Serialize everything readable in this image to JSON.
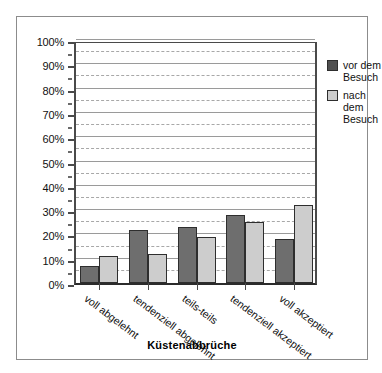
{
  "chart_data": {
    "type": "bar",
    "title": "",
    "xlabel": "Küstenabbrüche",
    "ylabel": "",
    "categories": [
      "voll abgelehnt",
      "tendenziell abgelehnt",
      "teils-teils",
      "tendenziell akzeptiert",
      "voll akzeptiert"
    ],
    "series": [
      {
        "name": "vor dem Besuch",
        "color": "#6e6e6e",
        "values": [
          7,
          22,
          23,
          28,
          18
        ]
      },
      {
        "name": "nach dem Besuch",
        "color": "#cdcdcd",
        "values": [
          11,
          12,
          19,
          25,
          32
        ]
      }
    ],
    "ylim": [
      0,
      100
    ],
    "y_unit": "%",
    "y_ticks": [
      0,
      10,
      20,
      30,
      40,
      50,
      60,
      70,
      80,
      90,
      100
    ],
    "y_tick_labels": [
      "0%",
      "10%",
      "20%",
      "30%",
      "40%",
      "50%",
      "60%",
      "70%",
      "80%",
      "90%",
      "100%"
    ],
    "y_minor_ticks": [
      5,
      15,
      25,
      35,
      45,
      55,
      65,
      75,
      85,
      95
    ],
    "grid": true,
    "grid_major_style": "solid",
    "grid_minor_style": "dashed",
    "legend_position": "right"
  },
  "legend": {
    "entries": [
      {
        "label": "vor dem\nBesuch",
        "swatch": "dark-gray-swatch"
      },
      {
        "label": "nach dem\nBesuch",
        "swatch": "light-gray-swatch"
      }
    ]
  },
  "axis": {
    "x_title": "Küstenabbrüche"
  }
}
